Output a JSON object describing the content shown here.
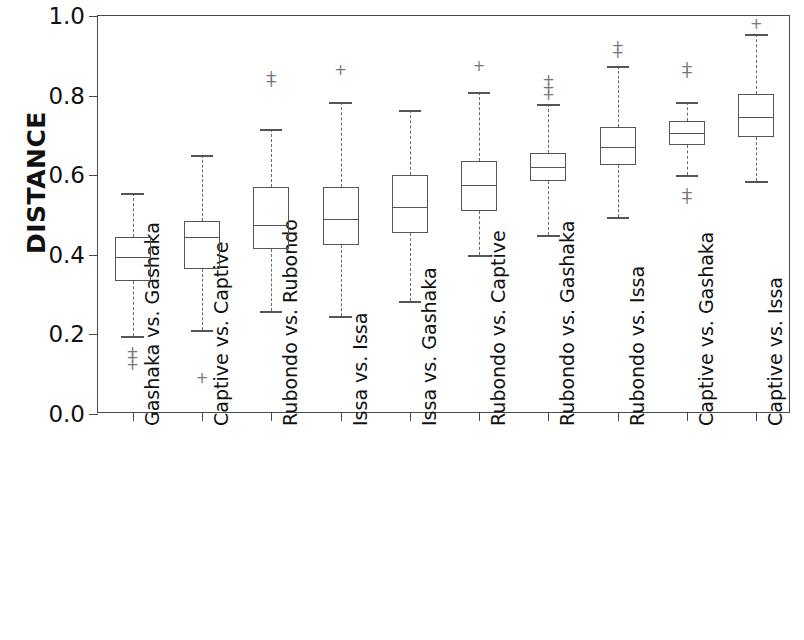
{
  "chart_data": {
    "type": "box",
    "title": "",
    "xlabel": "",
    "ylabel": "DISTANCE",
    "ylim": [
      0.0,
      1.0
    ],
    "yticks": [
      "0.0",
      "0.2",
      "0.4",
      "0.6",
      "0.8",
      "1.0"
    ],
    "ytick_values": [
      0.0,
      0.2,
      0.4,
      0.6,
      0.8,
      1.0
    ],
    "grid": false,
    "legend": null,
    "categories": [
      "Gashaka vs. Gashaka",
      "Captive vs. Captive",
      "Rubondo vs. Rubondo",
      "Issa vs. Issa",
      "Issa vs. Gashaka",
      "Rubondo vs. Captive",
      "Rubondo vs. Gashaka",
      "Rubondo vs. Issa",
      "Captive vs. Gashaka",
      "Captive vs. Issa"
    ],
    "boxes": [
      {
        "category": "Gashaka vs. Gashaka",
        "whisker_low": 0.195,
        "q1": 0.335,
        "median": 0.395,
        "q3": 0.445,
        "whisker_high": 0.555,
        "outliers": [
          0.155,
          0.14,
          0.122
        ]
      },
      {
        "category": "Captive vs. Captive",
        "whisker_low": 0.21,
        "q1": 0.365,
        "median": 0.445,
        "q3": 0.485,
        "whisker_high": 0.65,
        "outliers": [
          0.09
        ]
      },
      {
        "category": "Rubondo vs. Rubondo",
        "whisker_low": 0.26,
        "q1": 0.415,
        "median": 0.475,
        "q3": 0.57,
        "whisker_high": 0.715,
        "outliers": [
          0.848,
          0.835
        ]
      },
      {
        "category": "Issa vs. Issa",
        "whisker_low": 0.245,
        "q1": 0.425,
        "median": 0.49,
        "q3": 0.57,
        "whisker_high": 0.785,
        "outliers": [
          0.865
        ]
      },
      {
        "category": "Issa vs. Gashaka",
        "whisker_low": 0.285,
        "q1": 0.455,
        "median": 0.52,
        "q3": 0.6,
        "whisker_high": 0.765,
        "outliers": []
      },
      {
        "category": "Rubondo vs. Captive",
        "whisker_low": 0.4,
        "q1": 0.51,
        "median": 0.575,
        "q3": 0.635,
        "whisker_high": 0.81,
        "outliers": [
          0.875
        ]
      },
      {
        "category": "Rubondo vs. Gashaka",
        "whisker_low": 0.45,
        "q1": 0.585,
        "median": 0.62,
        "q3": 0.655,
        "whisker_high": 0.78,
        "outliers": [
          0.838,
          0.818,
          0.802
        ]
      },
      {
        "category": "Rubondo vs. Issa",
        "whisker_low": 0.495,
        "q1": 0.625,
        "median": 0.67,
        "q3": 0.72,
        "whisker_high": 0.875,
        "outliers": [
          0.925,
          0.908
        ]
      },
      {
        "category": "Captive vs. Gashaka",
        "whisker_low": 0.6,
        "q1": 0.675,
        "median": 0.705,
        "q3": 0.735,
        "whisker_high": 0.785,
        "outliers": [
          0.872,
          0.858,
          0.556,
          0.54
        ]
      },
      {
        "category": "Captive vs. Issa",
        "whisker_low": 0.585,
        "q1": 0.695,
        "median": 0.745,
        "q3": 0.805,
        "whisker_high": 0.955,
        "outliers": [
          0.98
        ]
      }
    ]
  },
  "colors": {
    "axis": "#4a4a4a",
    "box_line": "#555555",
    "whisker": "#6a6a6a",
    "outlier": "#777777",
    "background": "#ffffff",
    "text": "#111111"
  },
  "glyphs": {
    "outlier_marker": "+"
  }
}
